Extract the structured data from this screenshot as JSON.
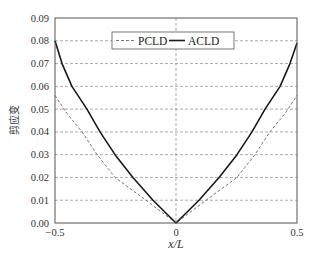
{
  "chart_data": {
    "type": "line",
    "title": "",
    "xlabel": "x/L",
    "ylabel": "剪应变",
    "xlim": [
      -0.5,
      0.5
    ],
    "ylim": [
      0.0,
      0.09
    ],
    "xticks": [
      -0.5,
      0,
      0.5
    ],
    "xtick_labels": [
      "−0.5",
      "0",
      "0.5"
    ],
    "yticks": [
      0.0,
      0.01,
      0.02,
      0.03,
      0.04,
      0.05,
      0.06,
      0.07,
      0.08,
      0.09
    ],
    "ytick_labels": [
      "0.00",
      "0.01",
      "0.02",
      "0.03",
      "0.04",
      "0.05",
      "0.06",
      "0.07",
      "0.08",
      "0.09"
    ],
    "grid": "dashed, horizontal at each y tick and vertical at x=0",
    "legend_position": "upper center, inside",
    "series": [
      {
        "name": "PCLD",
        "style": "dashed",
        "color": "#666666",
        "x": [
          -0.5,
          -0.45,
          -0.388,
          -0.326,
          -0.252,
          -0.124,
          0.0,
          0.124,
          0.252,
          0.326,
          0.388,
          0.45,
          0.5
        ],
        "y": [
          0.056,
          0.048,
          0.04,
          0.03,
          0.02,
          0.01,
          0.0,
          0.01,
          0.02,
          0.03,
          0.04,
          0.048,
          0.056
        ]
      },
      {
        "name": "ACLD",
        "style": "solid",
        "color": "#1a1a1a",
        "x": [
          -0.5,
          -0.471,
          -0.43,
          -0.368,
          -0.314,
          -0.252,
          -0.178,
          -0.095,
          0.0,
          0.095,
          0.178,
          0.252,
          0.314,
          0.368,
          0.43,
          0.471,
          0.5
        ],
        "y": [
          0.08,
          0.07,
          0.06,
          0.05,
          0.04,
          0.03,
          0.02,
          0.01,
          0.0,
          0.01,
          0.02,
          0.03,
          0.04,
          0.05,
          0.06,
          0.07,
          0.079
        ]
      }
    ]
  },
  "legend": {
    "items": [
      {
        "label": "PCLD",
        "style": "dashed"
      },
      {
        "label": "ACLD",
        "style": "solid"
      }
    ]
  },
  "axes": {
    "xlabel": "x/L",
    "ylabel": "剪应变"
  }
}
